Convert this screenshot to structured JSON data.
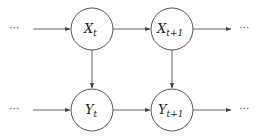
{
  "diagram": {
    "type": "dynamic-bayesian-network",
    "nodes": [
      {
        "id": "X_t",
        "base": "X",
        "subscript": "t",
        "cx": 92,
        "cy": 29,
        "r": 21
      },
      {
        "id": "X_t+1",
        "base": "X",
        "subscript": "t+1",
        "cx": 172,
        "cy": 29,
        "r": 21
      },
      {
        "id": "Y_t",
        "base": "Y",
        "subscript": "t",
        "cx": 92,
        "cy": 110,
        "r": 21
      },
      {
        "id": "Y_t+1",
        "base": "Y",
        "subscript": "t+1",
        "cx": 172,
        "cy": 110,
        "r": 21
      }
    ],
    "edges": [
      {
        "from": "…",
        "to": "X_t"
      },
      {
        "from": "X_t",
        "to": "X_t+1"
      },
      {
        "from": "X_t+1",
        "to": "…"
      },
      {
        "from": "…",
        "to": "Y_t"
      },
      {
        "from": "Y_t",
        "to": "Y_t+1"
      },
      {
        "from": "Y_t+1",
        "to": "…"
      },
      {
        "from": "X_t",
        "to": "Y_t"
      },
      {
        "from": "X_t+1",
        "to": "Y_t+1"
      }
    ],
    "ellipsis": "···",
    "colors": {
      "stroke": "#555555",
      "text": "#222222",
      "background": "#ffffff"
    }
  }
}
